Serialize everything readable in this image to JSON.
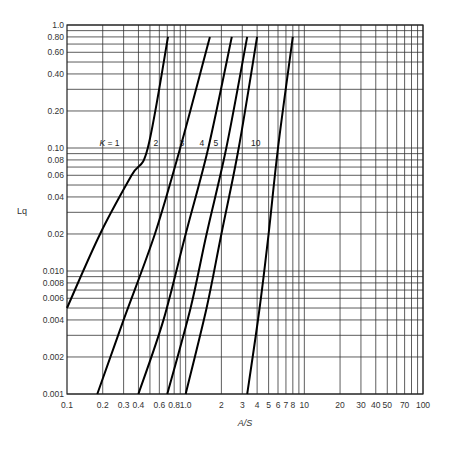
{
  "chart_data": {
    "type": "line",
    "title": "",
    "xlabel": "A/S",
    "ylabel": "Lq",
    "xscale": "log",
    "yscale": "log",
    "xlim": [
      0.1,
      100
    ],
    "ylim": [
      0.001,
      1.0
    ],
    "grid": true,
    "x_ticks": [
      {
        "v": 0.1,
        "label": "0.1"
      },
      {
        "v": 0.2,
        "label": "0.2"
      },
      {
        "v": 0.3,
        "label": "0.3"
      },
      {
        "v": 0.4,
        "label": "0.4"
      },
      {
        "v": 0.6,
        "label": "0.6"
      },
      {
        "v": 0.8,
        "label": "0.8"
      },
      {
        "v": 1.0,
        "label": "1.0"
      },
      {
        "v": 2,
        "label": "2"
      },
      {
        "v": 3,
        "label": "3"
      },
      {
        "v": 4,
        "label": "4"
      },
      {
        "v": 5,
        "label": "5"
      },
      {
        "v": 6,
        "label": "6"
      },
      {
        "v": 7,
        "label": "7"
      },
      {
        "v": 8,
        "label": "8"
      },
      {
        "v": 10,
        "label": "10"
      },
      {
        "v": 20,
        "label": "20"
      },
      {
        "v": 30,
        "label": "30"
      },
      {
        "v": 40,
        "label": "40"
      },
      {
        "v": 50,
        "label": "50"
      },
      {
        "v": 70,
        "label": "70"
      },
      {
        "v": 100,
        "label": "100"
      }
    ],
    "y_ticks": [
      {
        "v": 1.0,
        "label": "1.0"
      },
      {
        "v": 0.8,
        "label": "0.80"
      },
      {
        "v": 0.6,
        "label": "0.60"
      },
      {
        "v": 0.4,
        "label": "0.40"
      },
      {
        "v": 0.2,
        "label": "0.20"
      },
      {
        "v": 0.1,
        "label": "0.10"
      },
      {
        "v": 0.08,
        "label": "0.08"
      },
      {
        "v": 0.06,
        "label": "0.06"
      },
      {
        "v": 0.04,
        "label": "0.04"
      },
      {
        "v": 0.02,
        "label": "0.02"
      },
      {
        "v": 0.01,
        "label": "0.010"
      },
      {
        "v": 0.008,
        "label": "0.008"
      },
      {
        "v": 0.006,
        "label": "0.006"
      },
      {
        "v": 0.004,
        "label": "0.004"
      },
      {
        "v": 0.002,
        "label": "0.002"
      },
      {
        "v": 0.001,
        "label": "0.001"
      }
    ],
    "x_gridlines": [
      0.2,
      0.3,
      0.4,
      0.5,
      0.6,
      0.7,
      0.8,
      0.9,
      1,
      2,
      3,
      4,
      5,
      6,
      7,
      8,
      9,
      10,
      20,
      30,
      40,
      50,
      60,
      70,
      80,
      90,
      100
    ],
    "y_gridlines": [
      0.001,
      0.002,
      0.003,
      0.004,
      0.005,
      0.006,
      0.007,
      0.008,
      0.009,
      0.01,
      0.02,
      0.03,
      0.04,
      0.05,
      0.06,
      0.07,
      0.08,
      0.09,
      0.1,
      0.2,
      0.3,
      0.4,
      0.5,
      0.6,
      0.7,
      0.8,
      0.9,
      1.0
    ],
    "series": [
      {
        "name": "K = 1",
        "label": "K = 1",
        "label_pos": [
          0.22,
          0.11
        ],
        "x": [
          0.1,
          0.19,
          0.35,
          0.48,
          0.71
        ],
        "y": [
          0.005,
          0.02,
          0.06,
          0.1,
          0.8
        ]
      },
      {
        "name": "K = 2",
        "label": "2",
        "label_pos": [
          0.56,
          0.11
        ],
        "x": [
          0.18,
          0.3,
          0.55,
          0.9,
          1.6
        ],
        "y": [
          0.001,
          0.004,
          0.02,
          0.1,
          0.8
        ]
      },
      {
        "name": "K = 3",
        "label": "3",
        "label_pos": [
          0.93,
          0.11
        ],
        "x": [
          0.4,
          0.65,
          1.0,
          1.55,
          2.45
        ],
        "y": [
          0.001,
          0.004,
          0.02,
          0.1,
          0.8
        ]
      },
      {
        "name": "K = 4",
        "label": "4",
        "label_pos": [
          1.37,
          0.11
        ],
        "x": [
          0.7,
          1.1,
          1.5,
          2.2,
          3.3
        ],
        "y": [
          0.001,
          0.005,
          0.02,
          0.1,
          0.8
        ]
      },
      {
        "name": "K = 5",
        "label": "5",
        "label_pos": [
          1.8,
          0.11
        ],
        "x": [
          1.0,
          1.5,
          2.0,
          2.8,
          4.0
        ],
        "y": [
          0.001,
          0.005,
          0.02,
          0.1,
          0.8
        ]
      },
      {
        "name": "K = 10",
        "label": "10",
        "label_pos": [
          3.9,
          0.11
        ],
        "x": [
          3.3,
          4.2,
          5.0,
          6.0,
          8.0
        ],
        "y": [
          0.001,
          0.005,
          0.02,
          0.1,
          0.8
        ]
      }
    ]
  },
  "labels": {
    "x_axis_title": "A/S",
    "y_axis_title": "Lq"
  }
}
